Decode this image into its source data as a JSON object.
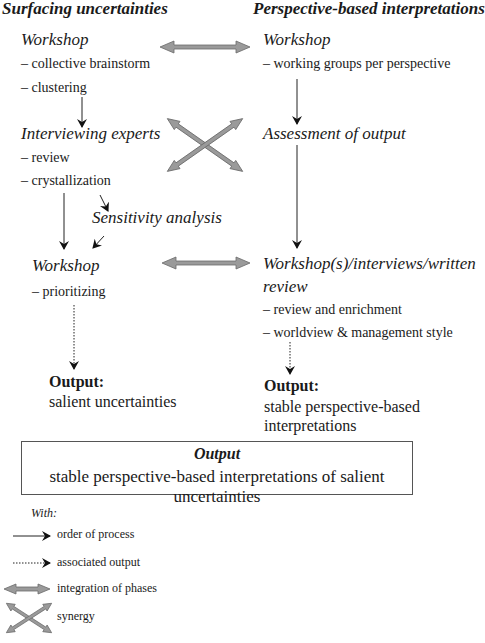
{
  "columns": {
    "left": {
      "title": "Surfacing uncertainties",
      "stages": [
        {
          "title": "Workshop",
          "bullets": [
            "– collective brainstorm",
            "– clustering"
          ]
        },
        {
          "title": "Interviewing experts",
          "bullets": [
            "– review",
            "– crystallization"
          ]
        },
        {
          "title": "Sensitivity analysis",
          "bullets": []
        },
        {
          "title": "Workshop",
          "bullets": [
            "– prioritizing"
          ]
        }
      ],
      "output": {
        "label": "Output:",
        "text": "salient uncertainties"
      }
    },
    "right": {
      "title": "Perspective-based interpretations",
      "stages": [
        {
          "title": "Workshop",
          "bullets": [
            "– working groups per perspective"
          ]
        },
        {
          "title": "Assessment of output",
          "bullets": []
        },
        {
          "title_line1": "Workshop(s)/interviews/written",
          "title_line2": "review",
          "bullets": [
            "– review and enrichment",
            "– worldview & management style"
          ]
        }
      ],
      "output": {
        "label": "Output:",
        "line1": "stable perspective-based",
        "line2": "interpretations"
      }
    }
  },
  "final_output": {
    "title": "Output",
    "text": "stable perspective-based interpretations of salient uncertainties"
  },
  "legend": {
    "heading": "With:",
    "items": [
      {
        "icon": "solid-arrow-icon",
        "label": "order of process"
      },
      {
        "icon": "dotted-arrow-icon",
        "label": "associated output"
      },
      {
        "icon": "double-arrow-icon",
        "label": "integration of phases"
      },
      {
        "icon": "cross-arrows-icon",
        "label": "synergy"
      }
    ]
  },
  "colors": {
    "text": "#1a1a1a",
    "integration_arrow_fill": "#9a9a9a",
    "integration_arrow_stroke": "#6a6a6a",
    "box_border": "#555555"
  }
}
